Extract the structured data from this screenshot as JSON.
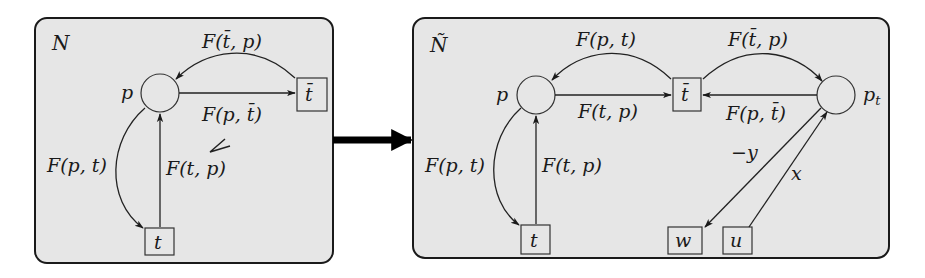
{
  "figure": {
    "arrow": {
      "direction": "left-to-right",
      "meaning": "transformation"
    },
    "left_net": {
      "title": "N",
      "places": [
        {
          "id": "p",
          "label": "p"
        }
      ],
      "transitions": [
        {
          "id": "t",
          "label": "t"
        },
        {
          "id": "tbar",
          "label": "t̄"
        }
      ],
      "arcs": [
        {
          "from": "tbar",
          "to": "p",
          "label": "F(t̄, p)"
        },
        {
          "from": "p",
          "to": "tbar",
          "label": "F(p, t̄)"
        },
        {
          "from": "p",
          "to": "t",
          "label": "F(p, t)"
        },
        {
          "from": "t",
          "to": "p",
          "label": "F(t, p)"
        }
      ],
      "annotation_mark": "check-mark"
    },
    "right_net": {
      "title": "Ñ",
      "places": [
        {
          "id": "p",
          "label": "p"
        },
        {
          "id": "pt",
          "label": "p",
          "subscript": "t"
        }
      ],
      "transitions": [
        {
          "id": "t",
          "label": "t"
        },
        {
          "id": "tbar",
          "label": "t̄"
        },
        {
          "id": "w",
          "label": "w"
        },
        {
          "id": "u",
          "label": "u"
        }
      ],
      "arcs": [
        {
          "from": "tbar",
          "to": "p",
          "label": "F(p, t)"
        },
        {
          "from": "p",
          "to": "tbar",
          "label": "F(t, p)"
        },
        {
          "from": "tbar",
          "to": "pt",
          "label": "F(t̄, p)"
        },
        {
          "from": "pt",
          "to": "tbar",
          "label": "F(p, t̄)"
        },
        {
          "from": "p",
          "to": "t",
          "label": "F(p, t)"
        },
        {
          "from": "t",
          "to": "p",
          "label": "F(t, p)"
        },
        {
          "from": "pt",
          "to": "w",
          "label": "−y"
        },
        {
          "from": "u",
          "to": "pt",
          "label": "x"
        }
      ]
    }
  }
}
